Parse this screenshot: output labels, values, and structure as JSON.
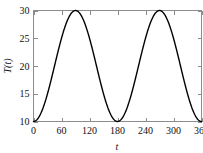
{
  "chart_data": {
    "type": "line",
    "title": "",
    "xlabel": "t",
    "ylabel": "T(t)",
    "xlim": [
      0,
      360
    ],
    "ylim": [
      10,
      30
    ],
    "grid": false,
    "legend": null,
    "xticks": [
      0,
      60,
      120,
      180,
      240,
      300,
      360
    ],
    "xtick_labels": [
      "0",
      "60",
      "120",
      "180",
      "240",
      "300",
      "360"
    ],
    "yticks": [
      10,
      15,
      20,
      25,
      30
    ],
    "ytick_labels": [
      "10",
      "15",
      "20",
      "25",
      "30"
    ],
    "series": [
      {
        "name": "T(t)",
        "formula": "T(t) = 20 - 10*cos(2*pi*t/180)",
        "period": 180,
        "amplitude": 10,
        "mean": 20,
        "color": "#000000",
        "x": [
          0,
          10,
          20,
          30,
          40,
          50,
          60,
          70,
          80,
          90,
          100,
          110,
          120,
          130,
          140,
          150,
          160,
          170,
          180,
          190,
          200,
          210,
          220,
          230,
          240,
          250,
          260,
          270,
          280,
          290,
          300,
          310,
          320,
          330,
          340,
          350,
          360
        ],
        "values": [
          10.0,
          10.6,
          12.3,
          15.0,
          18.2,
          21.7,
          25.0,
          27.7,
          29.4,
          30.0,
          29.4,
          27.7,
          25.0,
          21.7,
          18.2,
          15.0,
          12.3,
          10.6,
          10.0,
          10.6,
          12.3,
          15.0,
          18.2,
          21.7,
          25.0,
          27.7,
          29.4,
          30.0,
          29.4,
          27.7,
          25.0,
          21.7,
          18.2,
          15.0,
          12.3,
          10.6,
          10.0
        ]
      }
    ],
    "annotations": {
      "maxima": [
        {
          "t": 90,
          "T": 30
        },
        {
          "t": 270,
          "T": 30
        }
      ],
      "minima": [
        {
          "t": 0,
          "T": 10
        },
        {
          "t": 180,
          "T": 10
        },
        {
          "t": 360,
          "T": 10
        }
      ]
    },
    "style": {
      "axis_color": "#8c8c8c",
      "curve_color": "#000000",
      "background": "#ffffff",
      "tick_direction": "in"
    }
  }
}
